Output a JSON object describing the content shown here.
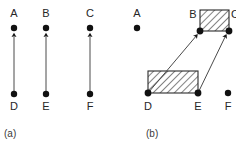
{
  "figure": {
    "width": 236,
    "height": 144,
    "background": "#ffffff",
    "ink": "#1a1a1a",
    "hatch_color": "#555555",
    "hatch_fill": "#ffffff"
  },
  "panels": [
    {
      "id": "a",
      "caption": "(a)",
      "caption_pos": {
        "x": 4,
        "y": 129
      },
      "nodes": [
        {
          "id": "A",
          "label": "A",
          "cx": 14,
          "cy": 28,
          "label_x": 7,
          "label_y": 8,
          "r": 3.2
        },
        {
          "id": "B",
          "label": "B",
          "cx": 46,
          "cy": 28,
          "label_x": 39,
          "label_y": 8,
          "r": 3.2
        },
        {
          "id": "C",
          "label": "C",
          "cx": 90,
          "cy": 28,
          "label_x": 83,
          "label_y": 8,
          "r": 3.2
        },
        {
          "id": "D",
          "label": "D",
          "cx": 14,
          "cy": 94,
          "label_x": 7,
          "label_y": 101,
          "r": 3.2
        },
        {
          "id": "E",
          "label": "E",
          "cx": 46,
          "cy": 94,
          "label_x": 39,
          "label_y": 101,
          "r": 3.2
        },
        {
          "id": "F",
          "label": "F",
          "cx": 90,
          "cy": 94,
          "label_x": 83,
          "label_y": 101,
          "r": 3.2
        }
      ],
      "arrows": [
        {
          "id": "D-A",
          "from": "D",
          "to": "A",
          "x1": 14,
          "y1": 91,
          "x2": 14,
          "y2": 33
        },
        {
          "id": "E-B",
          "from": "E",
          "to": "B",
          "x1": 46,
          "y1": 91,
          "x2": 46,
          "y2": 33
        },
        {
          "id": "F-C",
          "from": "F",
          "to": "C",
          "x1": 90,
          "y1": 91,
          "x2": 90,
          "y2": 33
        }
      ],
      "rects": []
    },
    {
      "id": "b",
      "caption": "(b)",
      "caption_pos": {
        "x": 28,
        "y": 129
      },
      "nodes": [
        {
          "id": "A",
          "label": "A",
          "cx": 19,
          "cy": 28,
          "label_x": 12,
          "label_y": 8,
          "r": 3.2
        },
        {
          "id": "B",
          "label": "B",
          "cx": 82,
          "cy": 31,
          "label_x": 68,
          "label_y": 9,
          "r": 3.4
        },
        {
          "id": "C",
          "label": "C",
          "cx": 111,
          "cy": 31,
          "label_x": 110,
          "label_y": 9,
          "r": 3.4
        },
        {
          "id": "D",
          "label": "D",
          "cx": 30,
          "cy": 93,
          "label_x": 23,
          "label_y": 101,
          "r": 3.4
        },
        {
          "id": "E",
          "label": "E",
          "cx": 80,
          "cy": 93,
          "label_x": 73,
          "label_y": 101,
          "r": 3.4
        },
        {
          "id": "F",
          "label": "F",
          "cx": 110,
          "cy": 93,
          "label_x": 103,
          "label_y": 101,
          "r": 3.2
        }
      ],
      "rects": [
        {
          "id": "rect-BC",
          "label": "hatched-region-BC",
          "x": 82,
          "y": 10,
          "w": 29,
          "h": 21
        },
        {
          "id": "rect-DE",
          "label": "hatched-region-DE",
          "x": 30,
          "y": 71,
          "w": 50,
          "h": 22
        }
      ],
      "arrows": [
        {
          "id": "D-B",
          "from": "D",
          "to": "B",
          "x1": 30,
          "y1": 93,
          "x2": 79,
          "y2": 34
        },
        {
          "id": "E-C",
          "from": "E",
          "to": "C",
          "x1": 80,
          "y1": 93,
          "x2": 108,
          "y2": 34
        }
      ]
    }
  ]
}
